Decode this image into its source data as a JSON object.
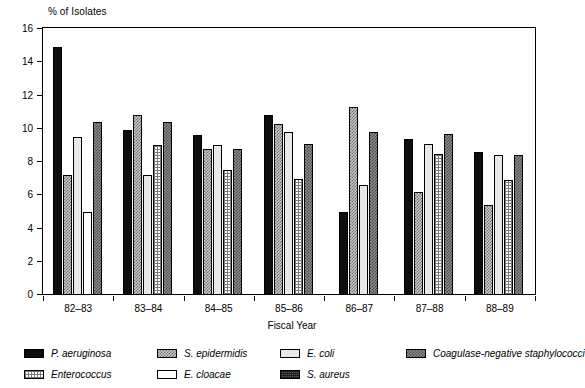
{
  "chart_data": {
    "type": "bar",
    "title": "",
    "ylabel": "% of Isolates",
    "xlabel": "Fiscal Year",
    "ylim": [
      0,
      16
    ],
    "yticks": [
      0,
      2,
      4,
      6,
      8,
      10,
      12,
      14,
      16
    ],
    "grid": false,
    "legend_position": "bottom",
    "categories": [
      "82–83",
      "83–84",
      "84–85",
      "85–86",
      "86–87",
      "87–88",
      "88–89"
    ],
    "series": [
      {
        "name": "P. aeruginosa",
        "key": "paeruginosa",
        "pattern": "solid-black",
        "values": [
          14.9,
          9.9,
          9.6,
          10.8,
          5.0,
          9.4,
          8.6
        ]
      },
      {
        "name": "S. epidermidis",
        "key": "sepidermidis",
        "pattern": "checker-light",
        "values": [
          7.2,
          10.8,
          8.8,
          10.3,
          11.3,
          6.2,
          5.4
        ]
      },
      {
        "name": "E. coli",
        "key": "ecoli",
        "pattern": "solid-lightgray",
        "values": [
          9.5,
          7.2,
          9.0,
          9.8,
          6.6,
          9.1,
          8.4
        ]
      },
      {
        "name": "Enterococcus",
        "key": "enterococcus",
        "pattern": "grid-fine",
        "values": [
          null,
          9.0,
          7.5,
          7.0,
          null,
          8.5,
          6.9
        ]
      },
      {
        "name": "E. cloacae",
        "key": "ecloacae",
        "pattern": "white",
        "values": [
          5.0,
          null,
          null,
          null,
          null,
          null,
          null
        ]
      },
      {
        "name": "S. aureus",
        "key": "saureus",
        "pattern": "dense-dark",
        "values": [
          null,
          null,
          null,
          null,
          null,
          null,
          null
        ]
      },
      {
        "name": "Coagulase-negative staphylococci",
        "key": "coagneg",
        "pattern": "checker-dark",
        "values": [
          10.4,
          10.4,
          8.8,
          9.1,
          9.8,
          9.7,
          8.4
        ]
      }
    ]
  },
  "axis": {
    "ylabel": "% of Isolates",
    "xlabel": "Fiscal Year",
    "ytick_labels": [
      "16",
      "14",
      "12",
      "10",
      "8",
      "6",
      "4",
      "2",
      "0"
    ],
    "xtick_labels": [
      "82–83",
      "83–84",
      "84–85",
      "85–86",
      "86–87",
      "87–88",
      "88–89"
    ]
  },
  "legend": {
    "items": [
      {
        "label": "P. aeruginosa",
        "pattern": "solid-black"
      },
      {
        "label": "S. epidermidis",
        "pattern": "checker-light"
      },
      {
        "label": "E. coli",
        "pattern": "solid-lightgray"
      },
      {
        "label": "Coagulase-negative staphylococci",
        "pattern": "checker-dark"
      },
      {
        "label": "Enterococcus",
        "pattern": "grid-fine"
      },
      {
        "label": "E. cloacae",
        "pattern": "white"
      },
      {
        "label": "S. aureus",
        "pattern": "dense-dark"
      }
    ]
  },
  "colors": {
    "paeruginosa": "#0d0d0d",
    "sepidermidis": "#c9c9c9",
    "ecoli": "#e8e8e8",
    "coagneg": "#8a8a8a",
    "enterococcus": "#ffffff",
    "ecloacae": "#ffffff",
    "saureus": "#5a5a5a",
    "axis": "#000000",
    "background": "#ffffff"
  }
}
